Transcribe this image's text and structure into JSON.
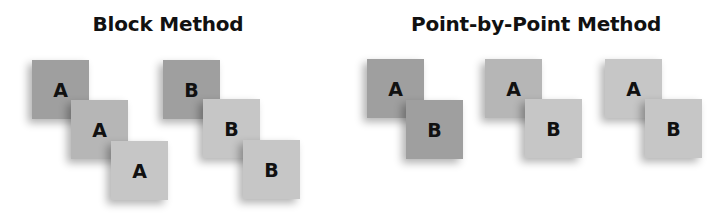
{
  "block": {
    "title": "Block Method",
    "squares": [
      {
        "label": "A",
        "shade": "dark",
        "x": 32,
        "y": 60
      },
      {
        "label": "A",
        "shade": "mid",
        "x": 71,
        "y": 100
      },
      {
        "label": "A",
        "shade": "light",
        "x": 111,
        "y": 141
      },
      {
        "label": "B",
        "shade": "dark",
        "x": 163,
        "y": 60
      },
      {
        "label": "B",
        "shade": "light",
        "x": 203,
        "y": 99
      },
      {
        "label": "B",
        "shade": "light",
        "x": 243,
        "y": 140
      }
    ]
  },
  "point": {
    "title": "Point-by-Point Method",
    "squares": [
      {
        "label": "A",
        "shade": "dark",
        "x": 367,
        "y": 59
      },
      {
        "label": "B",
        "shade": "dark",
        "x": 406,
        "y": 100
      },
      {
        "label": "A",
        "shade": "mid",
        "x": 485,
        "y": 59
      },
      {
        "label": "B",
        "shade": "light",
        "x": 525,
        "y": 99
      },
      {
        "label": "A",
        "shade": "light",
        "x": 605,
        "y": 59
      },
      {
        "label": "B",
        "shade": "light",
        "x": 645,
        "y": 99
      }
    ]
  },
  "colors": {
    "dark": "#9f9f9f",
    "mid": "#b6b6b6",
    "light": "#c6c6c6"
  }
}
